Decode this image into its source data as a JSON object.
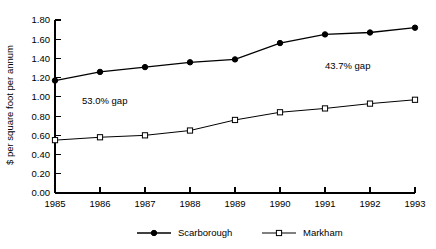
{
  "chart_data": {
    "type": "line",
    "title": "",
    "xlabel": "",
    "ylabel": "$ per square foot per annum",
    "categories": [
      "1985",
      "1986",
      "1987",
      "1988",
      "1989",
      "1990",
      "1991",
      "1992",
      "1993"
    ],
    "ylim": [
      0.0,
      1.8
    ],
    "ytick_labels": [
      "0.00",
      "0.20",
      "0.40",
      "0.60",
      "0.80",
      "1.00",
      "1.20",
      "1.40",
      "1.60",
      "1.80"
    ],
    "ytick_values": [
      0.0,
      0.2,
      0.4,
      0.6,
      0.8,
      1.0,
      1.2,
      1.4,
      1.6,
      1.8
    ],
    "grid": false,
    "legend_position": "bottom",
    "series": [
      {
        "name": "Scarborough",
        "marker": "filled-circle",
        "values": [
          1.17,
          1.26,
          1.31,
          1.36,
          1.39,
          1.56,
          1.65,
          1.67,
          1.72
        ]
      },
      {
        "name": "Markham",
        "marker": "open-square",
        "values": [
          0.55,
          0.58,
          0.6,
          0.65,
          0.76,
          0.84,
          0.88,
          0.93,
          0.97
        ]
      }
    ],
    "annotations": [
      {
        "text": "53.0% gap",
        "x": 1985.6,
        "y": 0.93
      },
      {
        "text": "43.7% gap",
        "x": 1991.0,
        "y": 1.29
      }
    ]
  },
  "colors": {
    "line": "#000000",
    "marker_fill_series1": "#000000",
    "marker_fill_series2": "#ffffff",
    "axis": "#000000",
    "background": "#ffffff"
  }
}
